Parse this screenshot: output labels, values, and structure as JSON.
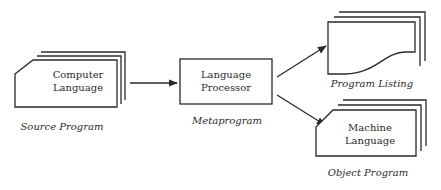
{
  "diagram": {
    "nodes": {
      "source": {
        "lines": [
          "Computer",
          "Language"
        ],
        "caption": "Source Program"
      },
      "processor": {
        "lines": [
          "Language",
          "Processor"
        ],
        "caption": "Metaprogram"
      },
      "listing": {
        "lines": [],
        "caption": "Program Listing"
      },
      "object": {
        "lines": [
          "Machine",
          "Language"
        ],
        "caption": "Object Program"
      }
    },
    "edges": [
      {
        "from": "source",
        "to": "processor"
      },
      {
        "from": "processor",
        "to": "listing"
      },
      {
        "from": "processor",
        "to": "object"
      }
    ],
    "colors": {
      "line": "#2a2a2a",
      "background": "#ffffff"
    }
  }
}
